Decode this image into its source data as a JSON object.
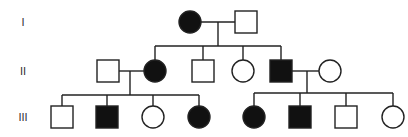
{
  "colors": {
    "affected": "#111111",
    "unaffected": "#ffffff",
    "stroke": "#222222"
  },
  "generations": [
    {
      "label": "I",
      "y": 22
    },
    {
      "label": "II",
      "y": 71
    },
    {
      "label": "III",
      "y": 117
    }
  ],
  "individuals": [
    {
      "id": "I-1",
      "generation": "I",
      "sex": "female",
      "affected": true,
      "x": 190,
      "y": 22
    },
    {
      "id": "I-2",
      "generation": "I",
      "sex": "male",
      "affected": false,
      "x": 246,
      "y": 22
    },
    {
      "id": "II-1",
      "generation": "II",
      "sex": "male",
      "affected": false,
      "x": 108,
      "y": 71
    },
    {
      "id": "II-2",
      "generation": "II",
      "sex": "female",
      "affected": true,
      "x": 155,
      "y": 71
    },
    {
      "id": "II-3",
      "generation": "II",
      "sex": "male",
      "affected": false,
      "x": 203,
      "y": 71
    },
    {
      "id": "II-4",
      "generation": "II",
      "sex": "female",
      "affected": false,
      "x": 243,
      "y": 71
    },
    {
      "id": "II-5",
      "generation": "II",
      "sex": "male",
      "affected": true,
      "x": 281,
      "y": 71
    },
    {
      "id": "II-6",
      "generation": "II",
      "sex": "female",
      "affected": false,
      "x": 330,
      "y": 71
    },
    {
      "id": "III-1",
      "generation": "III",
      "sex": "male",
      "affected": false,
      "x": 62,
      "y": 117
    },
    {
      "id": "III-2",
      "generation": "III",
      "sex": "male",
      "affected": true,
      "x": 107,
      "y": 117
    },
    {
      "id": "III-3",
      "generation": "III",
      "sex": "female",
      "affected": false,
      "x": 153,
      "y": 117
    },
    {
      "id": "III-4",
      "generation": "III",
      "sex": "female",
      "affected": true,
      "x": 199,
      "y": 117
    },
    {
      "id": "III-5",
      "generation": "III",
      "sex": "female",
      "affected": true,
      "x": 254,
      "y": 117
    },
    {
      "id": "III-6",
      "generation": "III",
      "sex": "male",
      "affected": true,
      "x": 300,
      "y": 117
    },
    {
      "id": "III-7",
      "generation": "III",
      "sex": "male",
      "affected": false,
      "x": 346,
      "y": 117
    },
    {
      "id": "III-8",
      "generation": "III",
      "sex": "female",
      "affected": false,
      "x": 393,
      "y": 117
    }
  ],
  "lines": [
    {
      "name": "mating-line-I",
      "x1": 201,
      "y1": 22,
      "x2": 235,
      "y2": 22
    },
    {
      "name": "descent-line-I",
      "x1": 218,
      "y1": 22,
      "x2": 218,
      "y2": 46
    },
    {
      "name": "sibship-line-II",
      "x1": 155,
      "y1": 46,
      "x2": 281,
      "y2": 46
    },
    {
      "name": "drop-II-2",
      "x1": 155,
      "y1": 46,
      "x2": 155,
      "y2": 60
    },
    {
      "name": "drop-II-3",
      "x1": 203,
      "y1": 46,
      "x2": 203,
      "y2": 60
    },
    {
      "name": "drop-II-4",
      "x1": 243,
      "y1": 46,
      "x2": 243,
      "y2": 60
    },
    {
      "name": "drop-II-5",
      "x1": 281,
      "y1": 46,
      "x2": 281,
      "y2": 60
    },
    {
      "name": "mating-line-II-left",
      "x1": 119,
      "y1": 71,
      "x2": 144,
      "y2": 71
    },
    {
      "name": "descent-line-II-left",
      "x1": 130,
      "y1": 71,
      "x2": 130,
      "y2": 95
    },
    {
      "name": "sibship-line-III-left",
      "x1": 62,
      "y1": 95,
      "x2": 199,
      "y2": 95
    },
    {
      "name": "drop-III-1",
      "x1": 62,
      "y1": 95,
      "x2": 62,
      "y2": 106
    },
    {
      "name": "drop-III-2",
      "x1": 107,
      "y1": 95,
      "x2": 107,
      "y2": 106
    },
    {
      "name": "drop-III-3",
      "x1": 153,
      "y1": 95,
      "x2": 153,
      "y2": 106
    },
    {
      "name": "drop-III-4",
      "x1": 199,
      "y1": 95,
      "x2": 199,
      "y2": 106
    },
    {
      "name": "mating-line-II-right",
      "x1": 292,
      "y1": 71,
      "x2": 319,
      "y2": 71
    },
    {
      "name": "descent-line-II-right",
      "x1": 307,
      "y1": 71,
      "x2": 307,
      "y2": 93
    },
    {
      "name": "sibship-line-III-right",
      "x1": 254,
      "y1": 93,
      "x2": 393,
      "y2": 93
    },
    {
      "name": "drop-III-5",
      "x1": 254,
      "y1": 93,
      "x2": 254,
      "y2": 106
    },
    {
      "name": "drop-III-6",
      "x1": 300,
      "y1": 93,
      "x2": 300,
      "y2": 106
    },
    {
      "name": "drop-III-7",
      "x1": 346,
      "y1": 93,
      "x2": 346,
      "y2": 106
    },
    {
      "name": "drop-III-8",
      "x1": 393,
      "y1": 93,
      "x2": 393,
      "y2": 106
    }
  ],
  "symbol_size": 22,
  "legend_text": []
}
